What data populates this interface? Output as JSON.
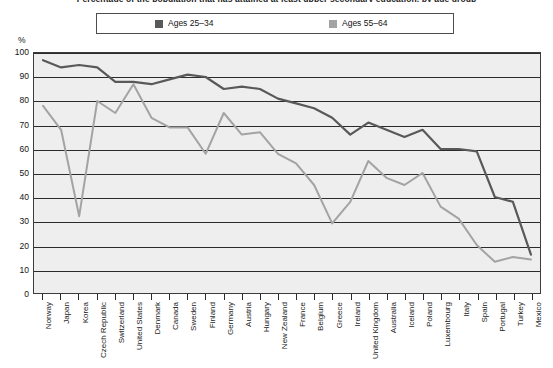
{
  "chart_title": "Percentage of the population that has attained at least upper secondary education, by age group",
  "axis_unit": "%",
  "legend": {
    "position": "top",
    "entries": [
      {
        "label": "Ages 25–34",
        "color": "#595959",
        "swatch": "legend-swatch-dark"
      },
      {
        "label": "Ages 55–64",
        "color": "#a3a3a3",
        "swatch": "legend-swatch-light"
      }
    ]
  },
  "chart_data": {
    "type": "line",
    "title": "Percentage of the population that has attained at least upper secondary education, by age group",
    "xlabel": "",
    "ylabel": "%",
    "ylim": [
      0,
      100
    ],
    "ytick_labels": [
      "0",
      "10",
      "20",
      "30",
      "40",
      "50",
      "60",
      "70",
      "80",
      "90",
      "100"
    ],
    "yticks": [
      0,
      10,
      20,
      30,
      40,
      50,
      60,
      70,
      80,
      90,
      100
    ],
    "grid": true,
    "legend_position": "top",
    "categories": [
      "Norway",
      "Japan",
      "Korea",
      "Czech Republic",
      "Switzerland",
      "United States",
      "Denmark",
      "Canada",
      "Sweden",
      "Finland",
      "Germany",
      "Austria",
      "Hungary",
      "New Zealand",
      "France",
      "Belgium",
      "Greece",
      "Ireland",
      "United Kingdom",
      "Australia",
      "Iceland",
      "Poland",
      "Luxembourg",
      "Italy",
      "Spain",
      "Portugal",
      "Turkey",
      "Mexico"
    ],
    "series": [
      {
        "name": "Ages 25–34",
        "color": "#595959",
        "values": [
          97,
          94,
          95,
          94,
          88,
          88,
          87,
          89,
          91,
          90,
          85,
          86,
          85,
          81,
          79,
          77,
          73,
          66,
          71,
          68,
          65,
          68,
          60,
          60,
          59,
          40,
          38,
          16
        ]
      },
      {
        "name": "Ages 55–64",
        "color": "#a3a3a3",
        "values": [
          78,
          68,
          32,
          80,
          75,
          87,
          73,
          69,
          69,
          58,
          75,
          66,
          67,
          58,
          54,
          45,
          29,
          38,
          55,
          48,
          45,
          50,
          36,
          31,
          20,
          13,
          15,
          14
        ]
      }
    ]
  }
}
